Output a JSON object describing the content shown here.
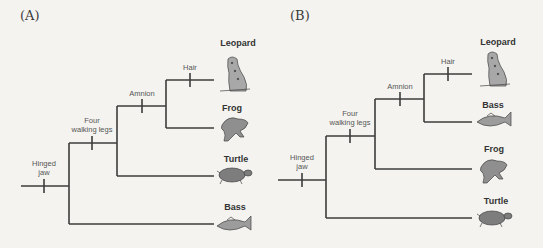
{
  "panels": [
    {
      "label": "(A)",
      "traits": {
        "hinged_jaw": "Hinged\njaw",
        "four_walking_legs": "Four\nwalking legs",
        "amnion": "Amnion",
        "hair": "Hair"
      },
      "taxa_top_to_bottom": [
        "Leopard",
        "Frog",
        "Turtle",
        "Bass"
      ]
    },
    {
      "label": "(B)",
      "traits": {
        "hinged_jaw": "Hinged\njaw",
        "four_walking_legs": "Four\nwalking legs",
        "amnion": "Amnion",
        "hair": "Hair"
      },
      "taxa_top_to_bottom": [
        "Leopard",
        "Bass",
        "Frog",
        "Turtle"
      ]
    }
  ],
  "colors": {
    "branch": "#3c3c3c",
    "text": "#333333",
    "animal_fill": "#8f8f8f"
  }
}
